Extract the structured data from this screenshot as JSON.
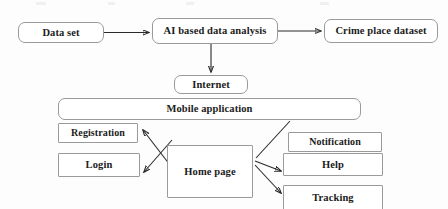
{
  "diagram": {
    "type": "flowchart",
    "background_color": "#fdfdfd",
    "node_border_color": "#9a9a9a",
    "edge_color": "#2a2a2a",
    "nodes": [
      {
        "id": "dataset",
        "label": "Data set",
        "shape": "rounded-rect"
      },
      {
        "id": "ai",
        "label": "AI based data analysis",
        "shape": "rounded-rect"
      },
      {
        "id": "crime",
        "label": "Crime place dataset",
        "shape": "rounded-rect"
      },
      {
        "id": "internet",
        "label": "Internet",
        "shape": "rounded-rect"
      },
      {
        "id": "mobile",
        "label": "Mobile application",
        "shape": "rounded-rect"
      },
      {
        "id": "registration",
        "label": "Registration",
        "shape": "rect"
      },
      {
        "id": "login",
        "label": "Login",
        "shape": "rect"
      },
      {
        "id": "homepage",
        "label": "Home page",
        "shape": "rect"
      },
      {
        "id": "notification",
        "label": "Notification",
        "shape": "rect"
      },
      {
        "id": "help",
        "label": "Help",
        "shape": "rect"
      },
      {
        "id": "tracking",
        "label": "Tracking",
        "shape": "rect"
      }
    ],
    "edges": [
      {
        "from": "dataset",
        "to": "ai",
        "arrow": "single"
      },
      {
        "from": "ai",
        "to": "crime",
        "arrow": "single"
      },
      {
        "from": "ai",
        "to": "internet",
        "arrow": "single"
      },
      {
        "from": "homepage",
        "to": "registration",
        "arrow": "single"
      },
      {
        "from": "homepage",
        "to": "login",
        "arrow": "single"
      },
      {
        "from": "homepage",
        "to": "mobile",
        "arrow": "none"
      },
      {
        "from": "homepage",
        "to": "help",
        "arrow": "single"
      },
      {
        "from": "homepage",
        "to": "tracking",
        "arrow": "single"
      }
    ]
  }
}
